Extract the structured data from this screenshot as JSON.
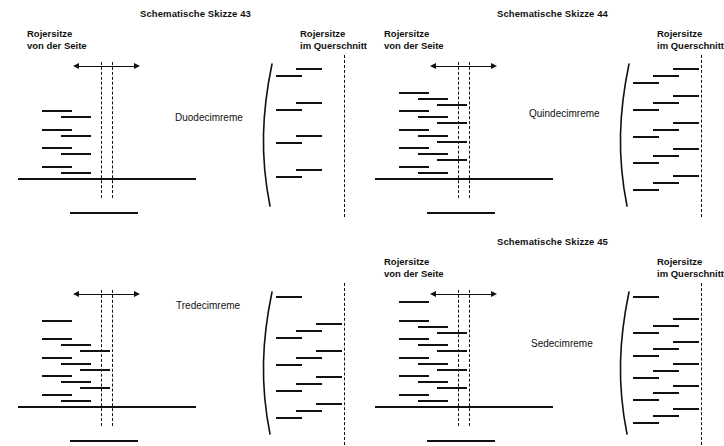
{
  "figure": {
    "language": "de",
    "line_color": "#111111",
    "background": "#ffffff"
  },
  "labels": {
    "side_view_line1": "Rojersitze",
    "side_view_line2": "von der Seite",
    "cross_section_line1": "Rojersitze",
    "cross_section_line2": "im Querschnitt"
  },
  "panels": [
    {
      "id": "sketch-43",
      "title": "Schematische Skizze 43",
      "ship_name": "Duodecimreme",
      "show_side_header": true,
      "show_cross_header": true,
      "side_rows": [
        {
          "strokes": 2
        },
        {
          "strokes": 2
        },
        {
          "strokes": 2
        },
        {
          "strokes": 2
        }
      ],
      "cross_rows": [
        {
          "strokes": 2
        },
        {
          "strokes": 2
        },
        {
          "strokes": 2
        },
        {
          "strokes": 2
        }
      ],
      "oar_total": 12
    },
    {
      "id": "sketch-44",
      "title": "Schematische Skizze 44",
      "ship_name": "Quindecimreme",
      "show_side_header": true,
      "show_cross_header": true,
      "side_rows": [
        {
          "strokes": 3
        },
        {
          "strokes": 3
        },
        {
          "strokes": 3
        },
        {
          "strokes": 3
        },
        {
          "strokes": 3
        }
      ],
      "cross_rows": [
        {
          "strokes": 3
        },
        {
          "strokes": 3
        },
        {
          "strokes": 3
        },
        {
          "strokes": 3
        },
        {
          "strokes": 3
        }
      ],
      "oar_total": 15
    },
    {
      "id": "sketch-tredecimreme",
      "title": "",
      "ship_name": "Tredecimreme",
      "show_side_header": false,
      "show_cross_header": false,
      "side_rows": [
        {
          "strokes": 1
        },
        {
          "strokes": 3
        },
        {
          "strokes": 3
        },
        {
          "strokes": 3
        },
        {
          "strokes": 3
        }
      ],
      "cross_rows": [
        {
          "strokes": 1
        },
        {
          "strokes": 3
        },
        {
          "strokes": 3
        },
        {
          "strokes": 3
        },
        {
          "strokes": 3
        }
      ],
      "oar_total": 13
    },
    {
      "id": "sketch-45",
      "title": "Schematische Skizze 45",
      "ship_name": "Sedecimreme",
      "show_side_header": true,
      "show_cross_header": true,
      "side_rows": [
        {
          "strokes": 1
        },
        {
          "strokes": 3
        },
        {
          "strokes": 3
        },
        {
          "strokes": 3
        },
        {
          "strokes": 3
        },
        {
          "strokes": 3
        }
      ],
      "cross_rows": [
        {
          "strokes": 1
        },
        {
          "strokes": 3
        },
        {
          "strokes": 3
        },
        {
          "strokes": 3
        },
        {
          "strokes": 3
        },
        {
          "strokes": 3
        }
      ],
      "oar_total": 16
    }
  ]
}
